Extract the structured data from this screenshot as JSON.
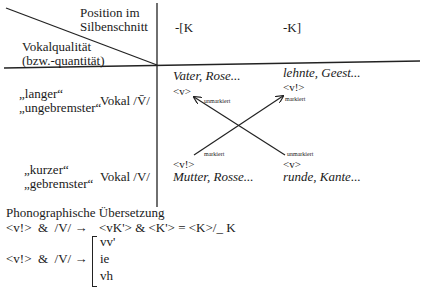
{
  "header": {
    "corner_top": [
      "Position im",
      "Silbenschnitt"
    ],
    "corner_bottom": [
      "Vokalqualität",
      "(bzw.-quantität)"
    ],
    "col1": "-[K",
    "col2": "-K]"
  },
  "rows": [
    {
      "labels": [
        "„langer“",
        "„ungebremster“"
      ],
      "vowel": "Vokal /V̄/",
      "cell1": {
        "examples": "Vater, Rose...",
        "grapheme": "<v>",
        "marking": "unmarkiert"
      },
      "cell2": {
        "examples": "lehnte, Geest...",
        "grapheme": "<v!>",
        "marking": "markiert"
      }
    },
    {
      "labels": [
        "„kurzer“",
        "„gebremster“"
      ],
      "vowel": "Vokal /V/",
      "cell1": {
        "examples": "Mutter, Rosse...",
        "grapheme": "<v!>",
        "marking": "markiert"
      },
      "cell2": {
        "examples": "runde, Kante...",
        "grapheme": "<v>",
        "marking": "unmarkiert"
      }
    }
  ],
  "translation": {
    "title": "Phonographische Übersetzung",
    "rule1_left": "<v!>  &  /V/ →",
    "rule1_right": "<vK'> & <K'> = <K>/_ K",
    "rule2_left": "<v!>  &  /V/ →",
    "rule2_options": [
      "vv'",
      "ie",
      "vh"
    ]
  }
}
